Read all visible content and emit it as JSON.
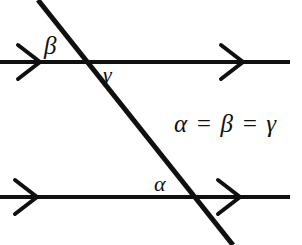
{
  "figure": {
    "name": "parallel-lines-cut-by-transversal",
    "background_color": "#ffffff",
    "stroke_color": "#101010",
    "width": 302,
    "height": 245
  },
  "labels": {
    "alpha": "α",
    "beta": "β",
    "gamma": "γ"
  },
  "equation": {
    "text": "α = β = γ"
  },
  "geometry": {
    "upper_parallel_line": {
      "name": "upper-parallel-line",
      "x1": 0,
      "y1": 62,
      "x2": 290,
      "y2": 62,
      "stroke_width": 4,
      "arrow_direction": "right",
      "arrowheads": [
        {
          "name": "upper-left-arrowhead",
          "vertex_x": 40,
          "vertex_y": 62
        },
        {
          "name": "upper-right-arrowhead",
          "vertex_x": 243,
          "vertex_y": 62
        }
      ]
    },
    "lower_parallel_line": {
      "name": "lower-parallel-line",
      "x1": 0,
      "y1": 197,
      "x2": 290,
      "y2": 197,
      "stroke_width": 4,
      "arrow_direction": "right",
      "arrowheads": [
        {
          "name": "lower-left-arrowhead",
          "vertex_x": 37,
          "vertex_y": 197
        },
        {
          "name": "lower-right-arrowhead",
          "vertex_x": 240,
          "vertex_y": 197
        }
      ]
    },
    "transversal_line": {
      "name": "transversal-line",
      "x1": 38,
      "y1": 0,
      "x2": 233,
      "y2": 245,
      "stroke_width": 5
    },
    "intersections": [
      {
        "name": "upper-intersection-point",
        "x": 82,
        "y": 62
      },
      {
        "name": "lower-intersection-point",
        "x": 192,
        "y": 197
      }
    ],
    "arrowhead_style": {
      "type": "open-chevron",
      "half_height": 17,
      "depth": 22
    }
  }
}
